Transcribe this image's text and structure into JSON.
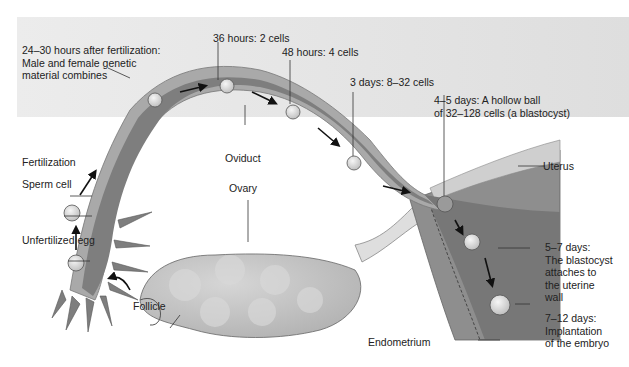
{
  "diagram": {
    "type": "anatomical-process",
    "structures": {
      "oviduct": "Oviduct",
      "ovary": "Ovary",
      "uterus": "Uterus",
      "endometrium": "Endometrium",
      "follicle": "Follicle"
    },
    "stages": [
      {
        "id": "unfertilized",
        "label": "Unfertilized egg"
      },
      {
        "id": "fertilization",
        "label": "Fertilization"
      },
      {
        "id": "sperm",
        "label": "Sperm cell"
      },
      {
        "id": "t24",
        "line1": "24–30 hours after fertilization:",
        "line2": "Male and female genetic",
        "line3": "material combines"
      },
      {
        "id": "t36",
        "label": "36 hours: 2 cells"
      },
      {
        "id": "t48",
        "label": "48 hours: 4 cells"
      },
      {
        "id": "d3",
        "label": "3 days: 8–32 cells"
      },
      {
        "id": "d45",
        "line1": "4–5 days: A hollow ball",
        "line2": "of 32–128 cells (a blastocyst)"
      },
      {
        "id": "d57",
        "line1": "5–7 days:",
        "line2": "The blastocyst",
        "line3": "attaches to",
        "line4": "the uterine",
        "line5": "wall"
      },
      {
        "id": "d712",
        "line1": "7–12 days:",
        "line2": "Implantation",
        "line3": "of the embryo"
      }
    ],
    "colors": {
      "background_band": "#e6e6e6",
      "tube_outer": "#a8a8a8",
      "tube_inner": "#7e7e7e",
      "ovary": "#c4c4c4",
      "uterus_wall": "#8c8c8c",
      "text": "#222222"
    }
  }
}
